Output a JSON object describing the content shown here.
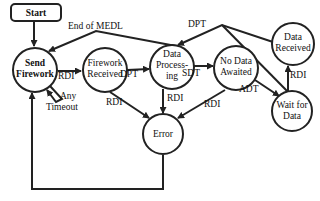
{
  "diagram": {
    "type": "state-machine",
    "nodes": {
      "start": {
        "label": "Start"
      },
      "send_firework": {
        "line1": "Send",
        "line2": "Firework"
      },
      "firework_received": {
        "line1": "Firework",
        "line2": "Received"
      },
      "data_processing": {
        "line1": "Data",
        "line2": "Process-",
        "line3": "ing"
      },
      "no_data_awaited": {
        "line1": "No Data",
        "line2": "Awaited"
      },
      "data_received": {
        "line1": "Data",
        "line2": "Received"
      },
      "wait_for_data": {
        "line1": "Wait for",
        "line2": "Data"
      },
      "error": {
        "label": "Error"
      }
    },
    "edges": {
      "end_of_medl": {
        "label": "End of MEDL",
        "from": "Data Processing",
        "to": "Send Firework"
      },
      "send_to_fw_rdi": {
        "label": "RDI",
        "from": "Send Firework",
        "to": "Firework Received"
      },
      "any_timeout_line1": "Any",
      "any_timeout_line2": "Timeout",
      "fw_to_dp_dpt": {
        "label": "DPT",
        "from": "Firework Received",
        "to": "Data Processing"
      },
      "dp_to_nda_sdt": {
        "label": "SDT",
        "from": "Data Processing",
        "to": "No Data Awaited"
      },
      "dr_to_dp_dpt": {
        "label": "DPT",
        "from": "Data Received",
        "to": "Data Processing"
      },
      "nda_to_wfd_adt": {
        "label": "ADT",
        "from": "No Data Awaited",
        "to": "Wait for Data"
      },
      "wfd_to_dr_rdi": {
        "label": "RDI",
        "from": "Wait for Data",
        "to": "Data Received"
      },
      "fw_to_error_rdi": {
        "label": "RDI",
        "from": "Firework Received",
        "to": "Error"
      },
      "dp_to_error_rdi": {
        "label": "RDI",
        "from": "Data Processing",
        "to": "Error"
      },
      "nda_to_error_rdi": {
        "label": "RDI",
        "from": "No Data Awaited",
        "to": "Error"
      }
    }
  }
}
